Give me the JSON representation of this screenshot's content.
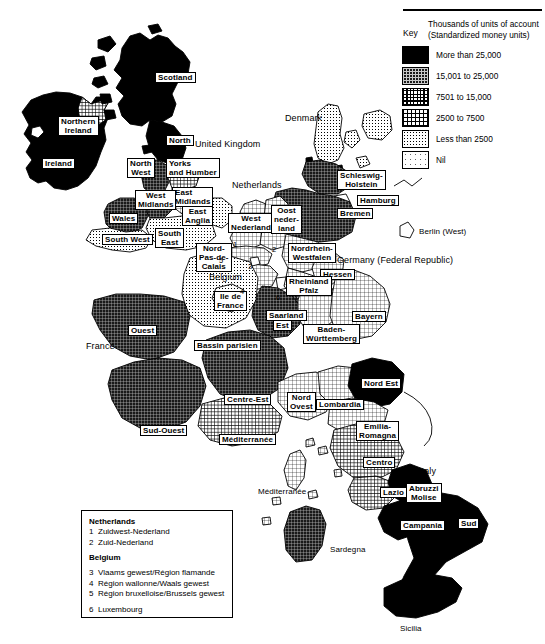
{
  "key": {
    "key_word": "Key",
    "title_line1": "Thousands of units of account",
    "title_line2": "(Standardized money units)",
    "classes": [
      {
        "label": "More than 25,000",
        "pattern": "solid-black",
        "swatch_name": "swatch-more-than-25000"
      },
      {
        "label": "15,001 to 25,000",
        "pattern": "dense-dark-grid",
        "swatch_name": "swatch-15001-to-25000"
      },
      {
        "label": "7501 to 15,000",
        "pattern": "medium-grid",
        "swatch_name": "swatch-7501-to-15000"
      },
      {
        "label": "2500 to 7500",
        "pattern": "light-grid",
        "swatch_name": "swatch-2500-to-7500"
      },
      {
        "label": "Less than 2500",
        "pattern": "fine-dots",
        "swatch_name": "swatch-less-than-2500"
      },
      {
        "label": "Nil",
        "pattern": "sparse-dots",
        "swatch_name": "swatch-nil"
      }
    ]
  },
  "countries": [
    {
      "name": "Ireland",
      "label": "Ireland",
      "style": "boxed"
    },
    {
      "name": "united-kingdom",
      "label": "United Kingdom",
      "style": "plain"
    },
    {
      "name": "netherlands",
      "label": "Netherlands",
      "style": "plain"
    },
    {
      "name": "belgium",
      "label": "Belgium",
      "style": "plain"
    },
    {
      "name": "denmark",
      "label": "Denmark",
      "style": "plain"
    },
    {
      "name": "germany-federal-republic",
      "label": "Germany (Federal Republic)",
      "style": "plain"
    },
    {
      "name": "france",
      "label": "France",
      "style": "plain"
    },
    {
      "name": "italy",
      "label": "Italy",
      "style": "plain"
    },
    {
      "name": "berlin-west",
      "label": "Berlin (West)",
      "style": "plain"
    },
    {
      "name": "sicilia",
      "label": "Sicilia",
      "style": "plain"
    },
    {
      "name": "sardegna",
      "label": "Sardegna",
      "style": "plain"
    }
  ],
  "regions": {
    "scotland": "Scotland",
    "northern_ireland": "Northern\nIreland",
    "north": "North",
    "north_west": "North\nWest",
    "yorks_humber": "Yorks\nand Humber",
    "east_midlands": "East\nMidlands",
    "west_midlands": "West\nMidlands",
    "wales": "Wales",
    "east_anglia": "East\nAnglia",
    "south_west": "South West",
    "south_east": "South\nEast",
    "nord_pas_de_calais": "Nord-\nPas-de-\nCalais",
    "west_nederland": "West\nNederland",
    "oost_nederland": "Oost\nneder-\nland",
    "schleswig_holstein": "Schleswig-\nHolstein",
    "hamburg": "Hamburg",
    "bremen": "Bremen",
    "nordrhein_westfalen": "Nordrhein-\nWestfalen",
    "hessen": "Hessen",
    "rheinland_pfalz": "Rheinland\nPfalz",
    "saarland": "Saarland",
    "est": "Est",
    "baden_wurttemberg": "Baden-\nWürttemberg",
    "bayern": "Bayern",
    "ile_de_france": "Ile de\nFrance",
    "bassin_parisien": "Bassin parisien",
    "ouest": "Ouest",
    "sud_ouest": "Sud-Ouest",
    "centre_est": "Centre-Est",
    "mediterranee_fr": "Méditerranée",
    "mediterranee_corse": "Méditerranée",
    "nord_ovest": "Nord\nOvest",
    "lombardia": "Lombardia",
    "nord_est": "Nord Est",
    "emilia_romagna": "Emilia-\nRomagna",
    "centro": "Centro",
    "lazio": "Lazio",
    "abruzzi_molise": "Abruzzi\nMolise",
    "campania": "Campania",
    "sud": "Sud"
  },
  "numbered_markers": [
    "1",
    "2",
    "3",
    "4",
    "5",
    "6"
  ],
  "notes": {
    "netherlands_heading": "Netherlands",
    "netherlands_items": [
      {
        "num": "1",
        "text": "Zuidwest-Nederland"
      },
      {
        "num": "2",
        "text": "Zuid-Nederland"
      }
    ],
    "belgium_heading": "Belgium",
    "belgium_items": [
      {
        "num": "3",
        "text": "Vlaams gewest/Région flamande"
      },
      {
        "num": "4",
        "text": "Région wallonne/Waals gewest"
      },
      {
        "num": "5",
        "text": "Région bruxelloise/Brussels gewest"
      }
    ],
    "luxembourg_item": {
      "num": "6",
      "text": "Luxembourg"
    }
  },
  "colors": {
    "ink": "#000000",
    "paper": "#ffffff"
  }
}
